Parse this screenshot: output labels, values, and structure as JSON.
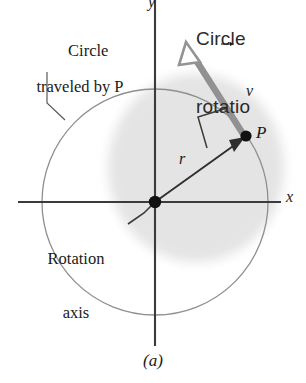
{
  "figure": {
    "caption": "(a)",
    "background_color": "#ffffff",
    "axes": {
      "x_label": "x",
      "y_label": "y",
      "origin_dot": "origin-dot",
      "axis_color": "#3a3a3a"
    },
    "circle": {
      "label_line_1": "Circle",
      "label_line_2": "traveled by P",
      "stroke_color": "#8a8a8a"
    },
    "disk_shading": {
      "name": "rotating-body-shading",
      "color": "#e6e6e6"
    },
    "rotation_axis": {
      "label_line_1": "Rotation",
      "label_line_2": "axis",
      "leader_dash": "–"
    },
    "point": {
      "label": "P",
      "color": "#000000"
    },
    "radius": {
      "label": "r",
      "color": "#2b2b2b"
    },
    "velocity": {
      "label": "v",
      "arrow_overline": "vector-arrow",
      "color": "#8f8f8f"
    },
    "right_angle_marker": {
      "name": "right-angle-marker",
      "color": "#2b2b2b"
    },
    "clipped_header": {
      "line_1": "Circle",
      "line_2": "rotatio",
      "color": "#2a2a2a"
    }
  }
}
